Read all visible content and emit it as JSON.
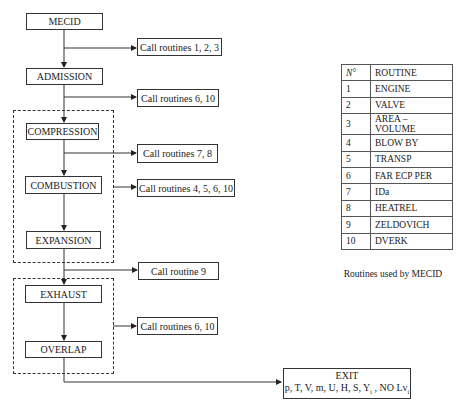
{
  "flowchart": {
    "nodes": {
      "mecid": "MECID",
      "admission": "ADMISSION",
      "compression": "COMPRESSION",
      "combustion": "COMBUSTION",
      "expansion": "EXPANSION",
      "exhaust": "EXHAUST",
      "overlap": "OVERLAP"
    },
    "calls": {
      "after_mecid": "Call routines 1, 2, 3",
      "after_admission": "Call routines 6, 10",
      "after_compression": "Call routines 7, 8",
      "combustion_group": "Call routines 4, 5, 6, 10",
      "after_expansion": "Call routine 9",
      "exhaust_group": "Call routines 6, 10"
    },
    "exit": {
      "title": "EXIT",
      "vars_main": "p, T, V, m, U, H, S, Y",
      "vars_sub1": "i",
      "vars_mid": " , NO Lv",
      "vars_sub2": "i"
    }
  },
  "routines_table": {
    "headers": [
      "N°",
      "ROUTINE"
    ],
    "rows": [
      {
        "n": "1",
        "name": "ENGINE"
      },
      {
        "n": "2",
        "name": "VALVE"
      },
      {
        "n": "3",
        "name": "AREA – VOLUME"
      },
      {
        "n": "4",
        "name": "BLOW BY"
      },
      {
        "n": "5",
        "name": "TRANSP"
      },
      {
        "n": "6",
        "name": "FAR ECP PER"
      },
      {
        "n": "7",
        "name": "IDa"
      },
      {
        "n": "8",
        "name": "HEATREL"
      },
      {
        "n": "9",
        "name": "ZELDOVICH"
      },
      {
        "n": "10",
        "name": "DVERK"
      }
    ],
    "caption": "Routines used by MECID"
  }
}
